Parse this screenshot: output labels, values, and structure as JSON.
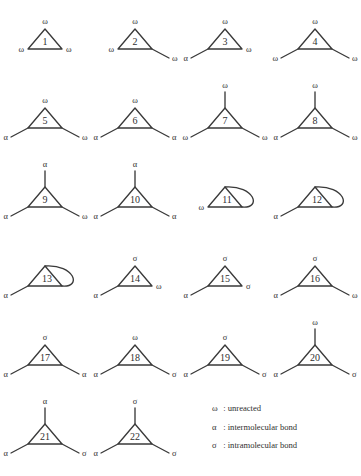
{
  "figure": {
    "symbols": {
      "omega": "ω",
      "alpha": "α",
      "sigma": "σ"
    },
    "structures": [
      {
        "id": "1",
        "apex": "ω",
        "apex_stem": false,
        "left": "ω",
        "left_stem": false,
        "right": "ω",
        "right_stem": false,
        "loop": false
      },
      {
        "id": "2",
        "apex": "ω",
        "apex_stem": false,
        "left": "ω",
        "left_stem": false,
        "right": "ω",
        "right_stem": true,
        "loop": false
      },
      {
        "id": "3",
        "apex": "ω",
        "apex_stem": false,
        "left": "α",
        "left_stem": true,
        "right": "ω",
        "right_stem": false,
        "loop": false
      },
      {
        "id": "4",
        "apex": "ω",
        "apex_stem": false,
        "left": "ω",
        "left_stem": true,
        "right": "ω",
        "right_stem": true,
        "loop": false
      },
      {
        "id": "5",
        "apex": "ω",
        "apex_stem": false,
        "left": "α",
        "left_stem": true,
        "right": "ω",
        "right_stem": true,
        "loop": false
      },
      {
        "id": "6",
        "apex": "ω",
        "apex_stem": false,
        "left": "α",
        "left_stem": true,
        "right": "α",
        "right_stem": true,
        "loop": false
      },
      {
        "id": "7",
        "apex": "ω",
        "apex_stem": true,
        "left": "ω",
        "left_stem": true,
        "right": "ω",
        "right_stem": true,
        "loop": false
      },
      {
        "id": "8",
        "apex": "ω",
        "apex_stem": true,
        "left": "α",
        "left_stem": true,
        "right": "ω",
        "right_stem": true,
        "loop": false
      },
      {
        "id": "9",
        "apex": "α",
        "apex_stem": true,
        "left": "α",
        "left_stem": true,
        "right": "ω",
        "right_stem": true,
        "loop": false
      },
      {
        "id": "10",
        "apex": "α",
        "apex_stem": true,
        "left": "α",
        "left_stem": true,
        "right": "α",
        "right_stem": true,
        "loop": false
      },
      {
        "id": "11",
        "apex": "",
        "apex_stem": false,
        "left": "ω",
        "left_stem": false,
        "right": "",
        "right_stem": false,
        "loop": true
      },
      {
        "id": "12",
        "apex": "",
        "apex_stem": false,
        "left": "α",
        "left_stem": true,
        "right": "",
        "right_stem": false,
        "loop": true
      },
      {
        "id": "13",
        "apex": "",
        "apex_stem": false,
        "left": "α",
        "left_stem": true,
        "right": "",
        "right_stem": false,
        "loop": true
      },
      {
        "id": "14",
        "apex": "σ",
        "apex_stem": false,
        "left": "α",
        "left_stem": true,
        "right": "ω",
        "right_stem": false,
        "loop": false
      },
      {
        "id": "15",
        "apex": "σ",
        "apex_stem": false,
        "left": "α",
        "left_stem": true,
        "right": "σ",
        "right_stem": false,
        "loop": false
      },
      {
        "id": "16",
        "apex": "σ",
        "apex_stem": false,
        "left": "α",
        "left_stem": true,
        "right": "ω",
        "right_stem": true,
        "loop": false
      },
      {
        "id": "17",
        "apex": "σ",
        "apex_stem": false,
        "left": "α",
        "left_stem": true,
        "right": "α",
        "right_stem": true,
        "loop": false
      },
      {
        "id": "18",
        "apex": "ω",
        "apex_stem": false,
        "left": "α",
        "left_stem": true,
        "right": "σ",
        "right_stem": true,
        "loop": false
      },
      {
        "id": "19",
        "apex": "σ",
        "apex_stem": false,
        "left": "α",
        "left_stem": true,
        "right": "σ",
        "right_stem": true,
        "loop": false
      },
      {
        "id": "20",
        "apex": "ω",
        "apex_stem": true,
        "left": "α",
        "left_stem": true,
        "right": "σ",
        "right_stem": true,
        "loop": false
      },
      {
        "id": "21",
        "apex": "α",
        "apex_stem": true,
        "left": "α",
        "left_stem": true,
        "right": "σ",
        "right_stem": true,
        "loop": false
      },
      {
        "id": "22",
        "apex": "σ",
        "apex_stem": true,
        "left": "α",
        "left_stem": true,
        "right": "σ",
        "right_stem": true,
        "loop": false
      }
    ],
    "legend": [
      {
        "symbol": "ω",
        "separator": ":",
        "text": "unreacted"
      },
      {
        "symbol": "α",
        "separator": ":",
        "text": "intermolecular bond"
      },
      {
        "symbol": "σ",
        "separator": ":",
        "text": "intramolecular bond"
      }
    ]
  }
}
